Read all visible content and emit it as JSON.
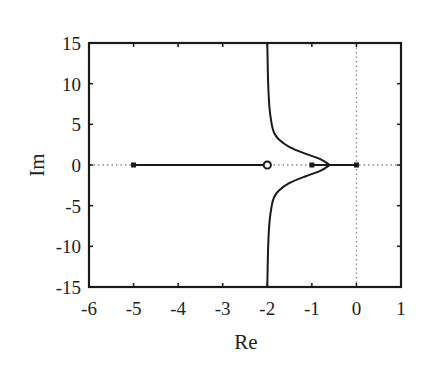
{
  "chart_data": {
    "type": "line",
    "title": "",
    "subtitle": "Root locus plot",
    "xlabel": "Re",
    "ylabel": "Im",
    "xlim": [
      -6,
      1
    ],
    "ylim": [
      -15,
      15
    ],
    "xticks": [
      -6,
      -5,
      -4,
      -3,
      -2,
      -1,
      0,
      1
    ],
    "yticks": [
      15,
      10,
      5,
      0,
      -5,
      -10,
      -15
    ],
    "grid": false,
    "legend": null,
    "poles": [
      {
        "re": -5,
        "im": 0
      },
      {
        "re": -1,
        "im": 0
      },
      {
        "re": 0,
        "im": 0
      }
    ],
    "zeros": [
      {
        "re": -2,
        "im": 0
      }
    ],
    "reference_lines": [
      {
        "orientation": "horizontal",
        "at": 0,
        "style": "dotted"
      },
      {
        "orientation": "vertical",
        "at": 0,
        "style": "dotted"
      }
    ],
    "series": [
      {
        "name": "real-axis-branch-left",
        "points": [
          [
            -5,
            0
          ],
          [
            -2,
            0
          ]
        ]
      },
      {
        "name": "real-axis-branch-right",
        "points": [
          [
            -1,
            0
          ],
          [
            0,
            0
          ]
        ]
      },
      {
        "name": "upper-branch",
        "points": [
          [
            -0.6,
            0
          ],
          [
            -0.8,
            0.7
          ],
          [
            -1.1,
            1.3
          ],
          [
            -1.5,
            2.2
          ],
          [
            -1.75,
            3.2
          ],
          [
            -1.85,
            4
          ],
          [
            -1.9,
            5
          ],
          [
            -1.95,
            7
          ],
          [
            -1.98,
            10
          ],
          [
            -2.0,
            15
          ]
        ]
      },
      {
        "name": "lower-branch",
        "points": [
          [
            -0.6,
            0
          ],
          [
            -0.8,
            -0.7
          ],
          [
            -1.1,
            -1.3
          ],
          [
            -1.5,
            -2.2
          ],
          [
            -1.75,
            -3.2
          ],
          [
            -1.85,
            -4
          ],
          [
            -1.9,
            -5
          ],
          [
            -1.95,
            -7
          ],
          [
            -1.98,
            -10
          ],
          [
            -2.0,
            -15
          ]
        ]
      }
    ]
  },
  "colors": {
    "line": "#1a1a1a",
    "dotted": "#888888",
    "background": "#ffffff"
  }
}
